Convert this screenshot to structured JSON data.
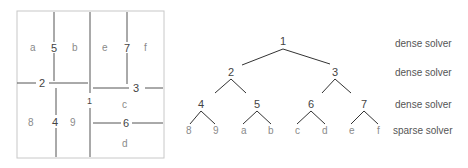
{
  "partition": {
    "regions": [
      "a",
      "b",
      "e",
      "f",
      "8",
      "9",
      "c",
      "d"
    ],
    "separators": [
      "1",
      "2",
      "3",
      "4",
      "5",
      "6",
      "7"
    ],
    "labels": {
      "a": "a",
      "b": "b",
      "e": "e",
      "f": "f",
      "r8": "8",
      "r9": "9",
      "c": "c",
      "d": "d",
      "s1": "1",
      "s2": "2",
      "s3": "3",
      "s4": "4",
      "s5": "5",
      "s6": "6",
      "s7": "7"
    }
  },
  "tree": {
    "nodes": {
      "n1": "1",
      "n2": "2",
      "n3": "3",
      "n4": "4",
      "n5": "5",
      "n6": "6",
      "n7": "7"
    },
    "leaves": {
      "l8": "8",
      "l9": "9",
      "la": "a",
      "lb": "b",
      "lc": "c",
      "ld": "d",
      "le": "e",
      "lf": "f"
    }
  },
  "levels": [
    {
      "label": "dense solver"
    },
    {
      "label": "dense solver"
    },
    {
      "label": "dense solver"
    },
    {
      "label": "sparse solver"
    }
  ]
}
